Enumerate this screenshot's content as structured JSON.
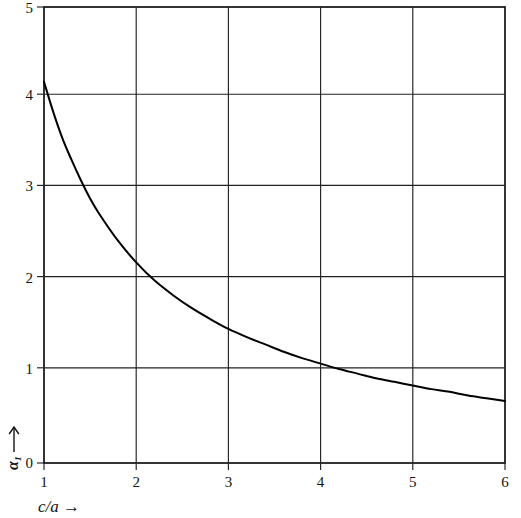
{
  "chart_data": {
    "type": "line",
    "title": "",
    "subtitle": "",
    "xlabel": "c/a →",
    "ylabel": "α₁ →",
    "xlim": [
      1,
      6
    ],
    "ylim": [
      0,
      5
    ],
    "grid": true,
    "legend": null,
    "xticks": [
      1,
      2,
      3,
      4,
      5,
      6
    ],
    "xtick_labels": [
      "1",
      "2",
      "3",
      "4",
      "5",
      "6"
    ],
    "yticks": [
      0,
      1,
      2,
      3,
      4,
      5
    ],
    "ytick_labels": [
      "0",
      "1",
      "2",
      "3",
      "4",
      "5"
    ],
    "series": [
      {
        "name": "alpha1",
        "x": [
          1.0,
          1.1,
          1.2,
          1.3,
          1.4,
          1.5,
          1.6,
          1.8,
          2.0,
          2.2,
          2.4,
          2.6,
          2.8,
          3.0,
          3.2,
          3.4,
          3.6,
          3.8,
          4.0,
          4.2,
          4.4,
          4.6,
          4.8,
          5.0,
          5.2,
          5.4,
          5.6,
          5.8,
          6.0
        ],
        "y": [
          4.18,
          3.85,
          3.56,
          3.32,
          3.1,
          2.9,
          2.73,
          2.44,
          2.2,
          2.0,
          1.84,
          1.7,
          1.58,
          1.47,
          1.38,
          1.3,
          1.22,
          1.15,
          1.09,
          1.03,
          0.98,
          0.93,
          0.89,
          0.85,
          0.81,
          0.78,
          0.74,
          0.71,
          0.68
        ]
      }
    ],
    "annotations": [
      {
        "label": "curve start value",
        "x": 1.0,
        "y": 4.18
      },
      {
        "label": "crosses y=2",
        "x": 2.2,
        "y": 2.0
      },
      {
        "label": "crosses y=1",
        "x": 3.9,
        "y": 1.0
      },
      {
        "label": "curve end value",
        "x": 6.0,
        "y": 0.68
      }
    ]
  },
  "axes": {
    "x_axis_label": "c/a →",
    "y_axis_label": "α₁",
    "y_axis_arrow": "↑",
    "x_axis_arrow": "→"
  },
  "ticks": {
    "x": [
      "1",
      "2",
      "3",
      "4",
      "5",
      "6"
    ],
    "y": [
      "5",
      "4",
      "3",
      "2",
      "1",
      "0"
    ]
  }
}
